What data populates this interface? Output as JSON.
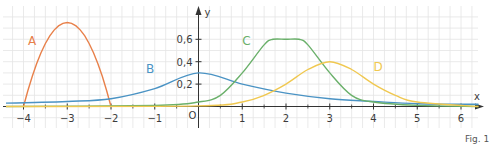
{
  "figure": {
    "caption": "Fig. 1"
  },
  "chart_data": {
    "type": "line",
    "title": "",
    "xlabel": "x",
    "ylabel": "y",
    "xlim": [
      -4.4,
      6.6
    ],
    "ylim": [
      -0.05,
      0.9
    ],
    "grid": true,
    "x_ticks": [
      -4,
      -3,
      -2,
      -1,
      1,
      2,
      3,
      4,
      5,
      6
    ],
    "x_tick_labels": [
      "−4",
      "−3",
      "−2",
      "−1",
      "1",
      "2",
      "3",
      "4",
      "5",
      "6"
    ],
    "y_ticks": [
      0.2,
      0.4,
      0.6
    ],
    "y_tick_labels": [
      "0,2",
      "0,4",
      "0,6"
    ],
    "origin_label": "O",
    "series": [
      {
        "name": "A",
        "color": "#e8804a",
        "description": "downward parabola, zeros at x=-4 and x=-2, vertex (-3, 0.75)",
        "x": [
          -4,
          -3.5,
          -3,
          -2.5,
          -2
        ],
        "values": [
          0,
          0.5625,
          0.75,
          0.5625,
          0
        ]
      },
      {
        "name": "B",
        "color": "#4a93c4",
        "description": "bell-shaped, wide, peak at x=0 of 0.3",
        "x": [
          -4.4,
          -3,
          -2,
          -1,
          0,
          1,
          2,
          3,
          4,
          5,
          6.4
        ],
        "values": [
          0.03,
          0.045,
          0.07,
          0.16,
          0.3,
          0.2,
          0.12,
          0.07,
          0.045,
          0.025,
          0.02
        ]
      },
      {
        "name": "C",
        "color": "#6ab06a",
        "description": "rises to plateau 0.6 between x≈1.7 and x≈2.3, then falls",
        "x": [
          -4.4,
          -1,
          0,
          0.5,
          1,
          1.5,
          1.7,
          2,
          2.3,
          2.5,
          3,
          3.5,
          4,
          5,
          6.4
        ],
        "values": [
          0,
          0.01,
          0.04,
          0.1,
          0.3,
          0.55,
          0.6,
          0.6,
          0.6,
          0.55,
          0.3,
          0.1,
          0.04,
          0.01,
          0
        ]
      },
      {
        "name": "D",
        "color": "#f0c850",
        "description": "bell-shaped, peak at x=3 of 0.4",
        "x": [
          -4.4,
          0,
          1,
          1.5,
          2,
          2.5,
          3,
          3.5,
          4,
          4.5,
          5,
          6.4
        ],
        "values": [
          0,
          0.005,
          0.04,
          0.1,
          0.2,
          0.33,
          0.4,
          0.33,
          0.2,
          0.1,
          0.04,
          0
        ]
      }
    ],
    "annotations": [
      {
        "text": "A",
        "x": -3.9,
        "y": 0.55
      },
      {
        "text": "B",
        "x": -1.2,
        "y": 0.3
      },
      {
        "text": "C",
        "x": 1.0,
        "y": 0.55
      },
      {
        "text": "D",
        "x": 4.0,
        "y": 0.32
      }
    ]
  }
}
